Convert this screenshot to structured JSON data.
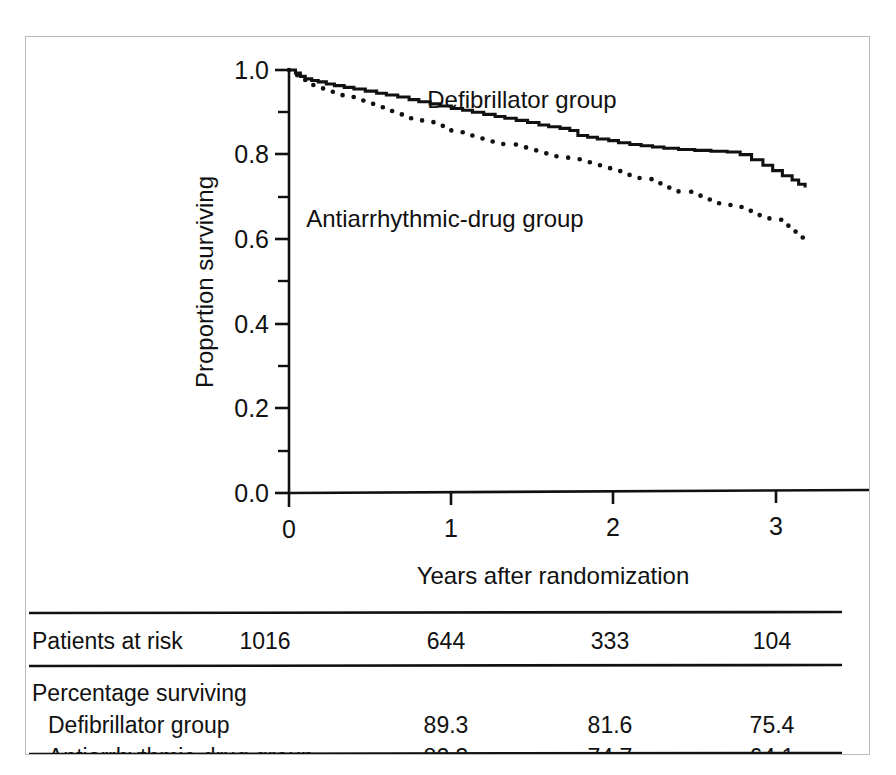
{
  "figure": {
    "background_color": "#ffffff",
    "frame_color": "#b9b9b9",
    "ink_color": "#111111"
  },
  "chart_data": {
    "type": "line",
    "title": "",
    "subtitle": "",
    "xlabel": "Years after randomization",
    "ylabel": "Proportion surviving",
    "xlim": [
      0,
      3.5
    ],
    "ylim": [
      0.0,
      1.0
    ],
    "grid": false,
    "legend_position": "inline-annotation",
    "x_ticks": [
      0,
      1,
      2,
      3
    ],
    "x_tick_labels": [
      "0",
      "1",
      "2",
      "3"
    ],
    "y_ticks": [
      0.0,
      0.2,
      0.4,
      0.6,
      0.8,
      1.0
    ],
    "y_tick_labels": [
      "0.0",
      "0.2",
      "0.4",
      "0.6",
      "0.8",
      "1.0"
    ],
    "y_minor_ticks": [
      0.1,
      0.3,
      0.5,
      0.7,
      0.9
    ],
    "series": [
      {
        "name": "Defibrillator group",
        "style": "solid",
        "annotation": "Defibrillator group",
        "annotation_x": 1.42,
        "annotation_y": 0.895,
        "points": [
          [
            0.0,
            1.0
          ],
          [
            0.04,
            0.993
          ],
          [
            0.07,
            0.985
          ],
          [
            0.1,
            0.979
          ],
          [
            0.14,
            0.975
          ],
          [
            0.18,
            0.972
          ],
          [
            0.23,
            0.967
          ],
          [
            0.28,
            0.963
          ],
          [
            0.34,
            0.959
          ],
          [
            0.4,
            0.955
          ],
          [
            0.47,
            0.95
          ],
          [
            0.54,
            0.945
          ],
          [
            0.6,
            0.941
          ],
          [
            0.67,
            0.936
          ],
          [
            0.74,
            0.93
          ],
          [
            0.8,
            0.925
          ],
          [
            0.87,
            0.92
          ],
          [
            0.93,
            0.915
          ],
          [
            1.0,
            0.909
          ],
          [
            1.07,
            0.905
          ],
          [
            1.13,
            0.9
          ],
          [
            1.2,
            0.895
          ],
          [
            1.27,
            0.89
          ],
          [
            1.33,
            0.886
          ],
          [
            1.4,
            0.881
          ],
          [
            1.47,
            0.876
          ],
          [
            1.54,
            0.87
          ],
          [
            1.6,
            0.866
          ],
          [
            1.67,
            0.862
          ],
          [
            1.73,
            0.857
          ],
          [
            1.78,
            0.845
          ],
          [
            1.84,
            0.841
          ],
          [
            1.9,
            0.837
          ],
          [
            1.97,
            0.833
          ],
          [
            2.03,
            0.828
          ],
          [
            2.1,
            0.824
          ],
          [
            2.17,
            0.821
          ],
          [
            2.24,
            0.818
          ],
          [
            2.31,
            0.815
          ],
          [
            2.4,
            0.812
          ],
          [
            2.5,
            0.81
          ],
          [
            2.6,
            0.808
          ],
          [
            2.7,
            0.806
          ],
          [
            2.78,
            0.8
          ],
          [
            2.85,
            0.788
          ],
          [
            2.92,
            0.775
          ],
          [
            2.98,
            0.762
          ],
          [
            3.04,
            0.75
          ],
          [
            3.1,
            0.74
          ],
          [
            3.14,
            0.73
          ],
          [
            3.18,
            0.722
          ]
        ]
      },
      {
        "name": "Antiarrhythmic-drug group",
        "style": "dotted",
        "annotation": "Antiarrhythmic-drug group",
        "annotation_x": 0.98,
        "annotation_y": 0.635,
        "points": [
          [
            0.0,
            1.0
          ],
          [
            0.05,
            0.985
          ],
          [
            0.1,
            0.968
          ],
          [
            0.15,
            0.957
          ],
          [
            0.21,
            0.95
          ],
          [
            0.27,
            0.943
          ],
          [
            0.33,
            0.936
          ],
          [
            0.4,
            0.928
          ],
          [
            0.47,
            0.92
          ],
          [
            0.54,
            0.912
          ],
          [
            0.61,
            0.903
          ],
          [
            0.68,
            0.895
          ],
          [
            0.75,
            0.886
          ],
          [
            0.82,
            0.877
          ],
          [
            0.89,
            0.868
          ],
          [
            0.96,
            0.859
          ],
          [
            1.0,
            0.853
          ],
          [
            1.08,
            0.845
          ],
          [
            1.16,
            0.838
          ],
          [
            1.24,
            0.831
          ],
          [
            1.32,
            0.824
          ],
          [
            1.4,
            0.817
          ],
          [
            1.48,
            0.81
          ],
          [
            1.56,
            0.803
          ],
          [
            1.64,
            0.796
          ],
          [
            1.72,
            0.789
          ],
          [
            1.8,
            0.782
          ],
          [
            1.88,
            0.775
          ],
          [
            1.96,
            0.768
          ],
          [
            2.0,
            0.761
          ],
          [
            2.08,
            0.752
          ],
          [
            2.16,
            0.742
          ],
          [
            2.24,
            0.732
          ],
          [
            2.32,
            0.722
          ],
          [
            2.4,
            0.712
          ],
          [
            2.48,
            0.703
          ],
          [
            2.56,
            0.694
          ],
          [
            2.64,
            0.685
          ],
          [
            2.72,
            0.676
          ],
          [
            2.8,
            0.667
          ],
          [
            2.88,
            0.657
          ],
          [
            2.96,
            0.646
          ],
          [
            3.04,
            0.632
          ],
          [
            3.1,
            0.618
          ],
          [
            3.15,
            0.604
          ],
          [
            3.19,
            0.59
          ]
        ]
      }
    ]
  },
  "risk_table": {
    "columns_x": [
      0,
      1,
      2,
      3
    ],
    "rows": [
      {
        "label": "Patients at risk",
        "indent": 0,
        "values": [
          "1016",
          "644",
          "333",
          "104"
        ]
      },
      {
        "label": "Percentage surviving",
        "indent": 0,
        "values": [
          "",
          "",
          "",
          ""
        ]
      },
      {
        "label": "Defibrillator group",
        "indent": 1,
        "values": [
          "",
          "89.3",
          "81.6",
          "75.4"
        ]
      },
      {
        "label": "Antiarrhythmic-drug group",
        "indent": 1,
        "values": [
          "",
          "82.3",
          "74.7",
          "64.1"
        ]
      }
    ]
  }
}
